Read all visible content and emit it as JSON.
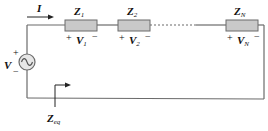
{
  "diagram": {
    "type": "series-impedance-circuit",
    "colors": {
      "wire": "#6b6b6b",
      "impedance_fill": "#c9c9c9",
      "impedance_stroke": "#6b6b6b",
      "text": "#111111"
    },
    "current": {
      "symbol": "I"
    },
    "source": {
      "symbol": "V",
      "plus": "+",
      "minus": "−",
      "icon": "ac-source-icon"
    },
    "impedances": [
      {
        "name": "Z",
        "sub": "1",
        "voltage": "V",
        "voltage_sub": "1",
        "plus": "+",
        "minus": "−"
      },
      {
        "name": "Z",
        "sub": "2",
        "voltage": "V",
        "voltage_sub": "2",
        "plus": "+",
        "minus": "−"
      },
      {
        "name": "Z",
        "sub": "N",
        "voltage": "V",
        "voltage_sub": "N",
        "plus": "+",
        "minus": "−"
      }
    ],
    "equivalent": {
      "name": "Z",
      "sub": "eq"
    }
  }
}
